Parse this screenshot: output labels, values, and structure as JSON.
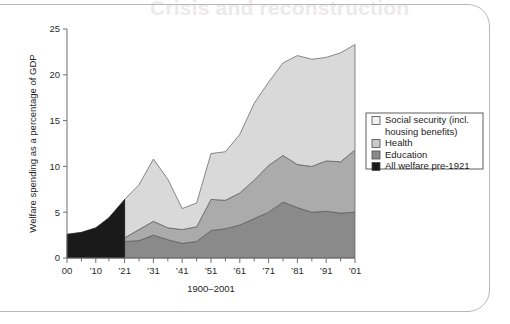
{
  "page": {
    "bleed_heading": "Crisis and reconstruction"
  },
  "chart_data": {
    "type": "area",
    "stacked": true,
    "title": "",
    "xlabel": "1900–2001",
    "ylabel": "Welfare spending as a percentage of GDP",
    "ylim": [
      0,
      25
    ],
    "yticks": [
      0,
      5,
      10,
      15,
      20,
      25
    ],
    "ytick_labels": [
      "0",
      "5",
      "10",
      "15",
      "20",
      "25"
    ],
    "grid": false,
    "legend_position": "right",
    "x": [
      1900,
      1905,
      1910,
      1915,
      1921,
      1926,
      1931,
      1936,
      1941,
      1946,
      1951,
      1956,
      1961,
      1966,
      1971,
      1976,
      1981,
      1986,
      1991,
      1996,
      2001
    ],
    "xticks": [
      1900,
      1910,
      1921,
      1931,
      1941,
      1951,
      1961,
      1971,
      1981,
      1991,
      2001
    ],
    "xtick_labels": [
      "00",
      "’10",
      "’21",
      "’31",
      "’41",
      "’51",
      "’61",
      "’71",
      "’81",
      "’91",
      "’01"
    ],
    "series": [
      {
        "name": "All welfare pre-1921",
        "color": "#1a1a1a",
        "x": [
          1900,
          1905,
          1910,
          1915,
          1921
        ],
        "values": [
          2.6,
          2.8,
          3.3,
          4.4,
          6.4
        ]
      },
      {
        "name": "Education",
        "color": "#8a8a8a",
        "x": [
          1921,
          1926,
          1931,
          1936,
          1941,
          1946,
          1951,
          1956,
          1961,
          1966,
          1971,
          1976,
          1981,
          1986,
          1991,
          1996,
          2001
        ],
        "values": [
          1.8,
          1.9,
          2.5,
          2.0,
          1.6,
          1.8,
          3.0,
          3.2,
          3.6,
          4.3,
          5.0,
          6.1,
          5.5,
          5.0,
          5.1,
          4.9,
          5.0
        ]
      },
      {
        "name": "Health",
        "color": "#ababab",
        "x": [
          1921,
          1926,
          1931,
          1936,
          1941,
          1946,
          1951,
          1956,
          1961,
          1966,
          1971,
          1976,
          1981,
          1986,
          1991,
          1996,
          2001
        ],
        "values": [
          0.4,
          1.2,
          1.5,
          1.3,
          1.5,
          1.6,
          3.4,
          3.1,
          3.5,
          4.2,
          5.1,
          5.1,
          4.7,
          5.0,
          5.5,
          5.6,
          6.8
        ]
      },
      {
        "name": "Social security (incl. housing benefits)",
        "color": "#d9d9d9",
        "x": [
          1921,
          1926,
          1931,
          1936,
          1941,
          1946,
          1951,
          1956,
          1961,
          1966,
          1971,
          1976,
          1981,
          1986,
          1991,
          1996,
          2001
        ],
        "values": [
          4.2,
          4.9,
          6.8,
          5.3,
          2.3,
          2.6,
          5.0,
          5.3,
          6.4,
          8.4,
          9.1,
          10.1,
          11.9,
          11.7,
          11.3,
          11.9,
          11.5
        ]
      }
    ],
    "cumulative_totals": {
      "note": "stacked top line",
      "x": [
        1921,
        1926,
        1931,
        1936,
        1941,
        1946,
        1951,
        1956,
        1961,
        1966,
        1971,
        1976,
        1981,
        1986,
        1991,
        1996,
        2001
      ],
      "values": [
        6.4,
        8.0,
        10.8,
        8.6,
        5.4,
        6.0,
        11.4,
        11.6,
        13.5,
        16.9,
        19.2,
        21.3,
        22.1,
        21.7,
        21.9,
        22.4,
        23.3
      ]
    }
  },
  "legend": {
    "items": [
      {
        "label": "Social security (incl.",
        "label2": "housing benefits)",
        "swatch": "#f2f2f2"
      },
      {
        "label": "Health",
        "swatch": "#c9c9c9"
      },
      {
        "label": "Education",
        "swatch": "#8a8a8a"
      },
      {
        "label": "All welfare pre-1921",
        "swatch": "#1a1a1a"
      }
    ]
  }
}
